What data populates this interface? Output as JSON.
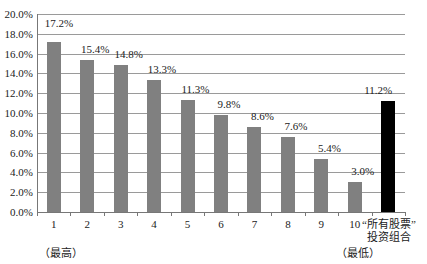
{
  "chart_data": {
    "type": "bar",
    "title": "",
    "xlabel": "",
    "ylabel": "",
    "ylim": [
      0,
      20
    ],
    "y_ticks": [
      "0.0%",
      "2.0%",
      "4.0%",
      "6.0%",
      "8.0%",
      "10.0%",
      "12.0%",
      "14.0%",
      "16.0%",
      "18.0%",
      "20.0%"
    ],
    "grid": true,
    "categories": [
      "1",
      "2",
      "3",
      "4",
      "5",
      "6",
      "7",
      "8",
      "9",
      "10",
      "“所有股票”投资组合"
    ],
    "values": [
      17.2,
      15.4,
      14.8,
      13.3,
      11.3,
      9.8,
      8.6,
      7.6,
      5.4,
      3.0,
      11.2
    ],
    "value_labels": [
      "17.2%",
      "15.4%",
      "14.8%",
      "13.3%",
      "11.3%",
      "9.8%",
      "8.6%",
      "7.6%",
      "5.4%",
      "3.0%",
      "11.2%"
    ],
    "bar_colors": [
      "#808080",
      "#808080",
      "#808080",
      "#808080",
      "#808080",
      "#808080",
      "#808080",
      "#808080",
      "#808080",
      "#808080",
      "#000000"
    ],
    "annotations": [
      "（最高）",
      "（最低）"
    ],
    "legend": null
  },
  "labels": {
    "last_category_line1": "“所有股票”",
    "last_category_line2": "投资组合",
    "highest_note": "（最高）",
    "lowest_note": "（最低）"
  }
}
